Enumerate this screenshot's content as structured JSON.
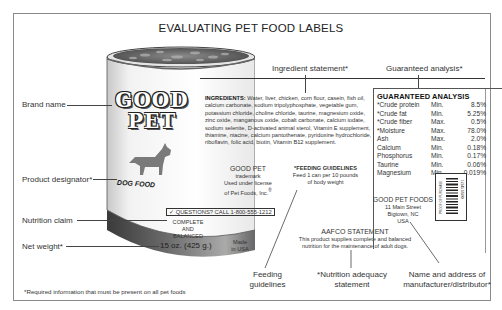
{
  "title": "EVALUATING PET FOOD LABELS",
  "callouts": {
    "brand_name": "Brand name",
    "product_designator": "Product designator*",
    "nutrition_claim": "Nutrition claim",
    "net_weight": "Net weight*",
    "ingredient_statement": "Ingredient statement*",
    "guaranteed_analysis": "Guaranteed analysis*",
    "feeding_guidelines_l1": "Feeding",
    "feeding_guidelines_l2": "guidelines",
    "nutrition_adequacy_l1": "*Nutrition adequacy",
    "nutrition_adequacy_l2": "statement",
    "manufacturer_l1": "Name and address of",
    "manufacturer_l2": "manufacturer/distributor*"
  },
  "footnote": "*Required information that must be present on all pet foods",
  "can": {
    "brand_line1": "GOOD",
    "brand_line2": "PET",
    "designator": "DOG FOOD",
    "questions": "QUESTIONS? CALL 1-800-555-1212",
    "claim_l1": "COMPLETE",
    "claim_l2": "AND",
    "claim_l3": "BALANCED",
    "net_weight": "15 oz. (425 g.)",
    "made_l1": "Made",
    "made_l2": "in USA",
    "trademark_l1": "GOOD PET",
    "trademark_l2": "trademark",
    "trademark_l3": "Used under license",
    "trademark_l4": "of Pet Foods, Inc.",
    "registered": "®",
    "feeding_title": "*FEEDING GUIDELINES",
    "feeding_l1": "Feed 1 can per 10 pounds",
    "feeding_l2": "of body weight",
    "aafco_title": "AAFCO STATEMENT",
    "aafco_l1": "This product supplies complete and balanced",
    "aafco_l2": "nutrition for the maintenance of adult dogs.",
    "ingredients_label": "INGREDIENTS:",
    "ingredients_text": "Water, liver, chicken, corn flour, casein, fish oil, calcium carbonate, sodium tripolyphosphate, vegetable gum, potassium chloride, choline chloride, taurine, magnesium oxide, zinc oxide, manganous oxide, cobalt carbonate, calcium iodate, sodium selenite, D-activated animal sterol, Vitamin E supplement, thiamine, niacine, calcium pantothenate, pyridoxine hydrochloride, riboflavin, folic acid, biotin, Vitamin B12 supplement.",
    "manufacturer_name": "GOOD PET FOODS",
    "manufacturer_street": "11 Main Street",
    "manufacturer_city": "Bigtown, NC",
    "manufacturer_country": "USA",
    "barcode_side_text": "PROOF OF PURCHASE",
    "barcode_number": "12345 67890"
  },
  "guaranteed_analysis": {
    "title": "GUARANTEED ANALYSIS",
    "rows": [
      {
        "name": "*Crude protein",
        "type": "Min.",
        "value": "8.5%"
      },
      {
        "name": "*Crude fat",
        "type": "Min.",
        "value": "5.25%"
      },
      {
        "name": "*Crude fiber",
        "type": "Max.",
        "value": "0.5%"
      },
      {
        "name": "*Moisture",
        "type": "Max.",
        "value": "78.0%"
      },
      {
        "name": "Ash",
        "type": "Max.",
        "value": "2.0%"
      },
      {
        "name": "Calcium",
        "type": "Min.",
        "value": "0.18%"
      },
      {
        "name": "Phosphorus",
        "type": "Min.",
        "value": "0.17%"
      },
      {
        "name": "Taurine",
        "type": "Min.",
        "value": "0.06%"
      },
      {
        "name": "Magnesium",
        "type": "Min.",
        "value": "0.019%"
      }
    ]
  },
  "colors": {
    "frame_border": "#8a8a8a",
    "can_shadow": "#555555",
    "dog_silhouette": "#7a7a7a"
  }
}
